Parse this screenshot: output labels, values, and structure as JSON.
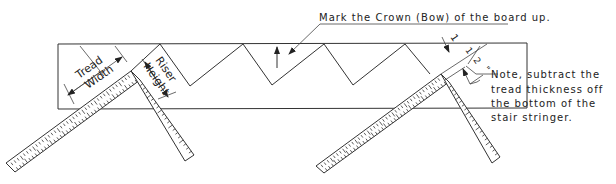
{
  "diagram": {
    "annotations": {
      "crown": "Mark the Crown (Bow) of the board up.",
      "tread_width": [
        "Tread",
        "Width"
      ],
      "riser_height": [
        "Riser",
        "Height"
      ],
      "dimension": "1 1/2\"",
      "dimension_whole": "1",
      "dimension_frac_num": "1",
      "dimension_frac_den": "2",
      "dimension_unit": "\"",
      "note_lines": [
        "Note, subtract the",
        "tread thickness off",
        "the bottom of the",
        "stair stringer."
      ]
    },
    "colors": {
      "line": "#333333",
      "background": "#ffffff",
      "text": "#222222"
    }
  }
}
